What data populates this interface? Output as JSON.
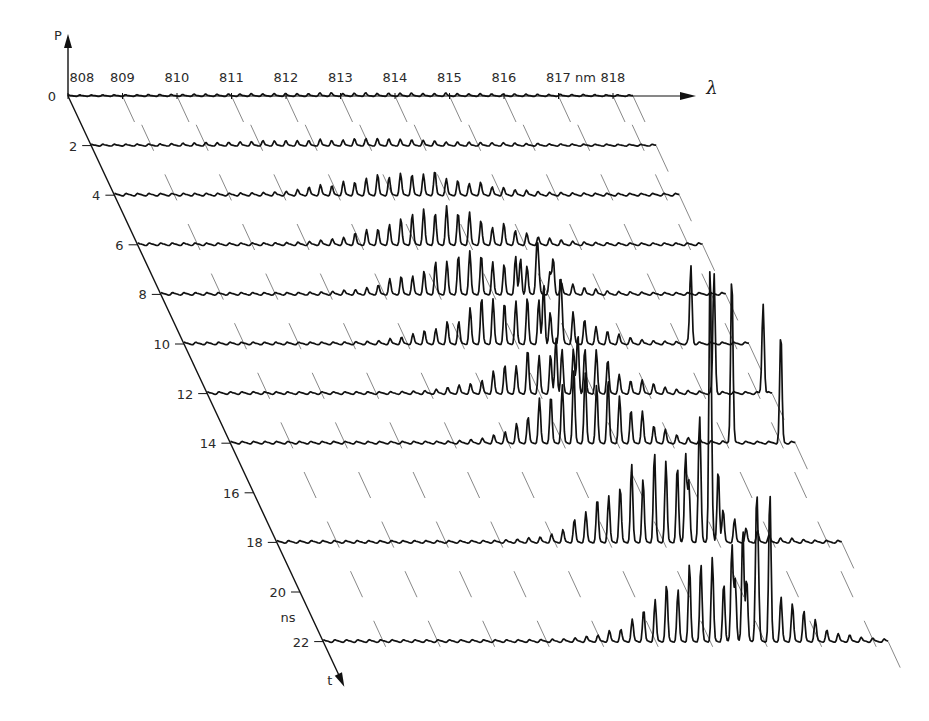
{
  "chart_data": {
    "type": "waterfall-line",
    "title": "",
    "xlabel": "λ",
    "x_unit": "nm",
    "x_unit_label_position_after": 817,
    "x_ticks": [
      808,
      809,
      810,
      811,
      812,
      813,
      814,
      815,
      816,
      817,
      818
    ],
    "ylabel": "P",
    "y_zero_label": "0",
    "zlabel": "t",
    "z_unit": "ns",
    "z_ticks": [
      0,
      2,
      4,
      6,
      8,
      10,
      12,
      14,
      16,
      18,
      20,
      22
    ],
    "z_tick_labels": [
      "0",
      "2",
      "4",
      "6",
      "8",
      "10",
      "12",
      "14",
      "16",
      "18",
      "20",
      "22"
    ],
    "mode_spacing_nm": 0.21,
    "grid": false,
    "legend": null,
    "series": [
      {
        "t_ns": 0,
        "center_nm": 813.5,
        "width_nm": 2.5,
        "peak": 2,
        "floor": 1.5,
        "spikes": []
      },
      {
        "t_ns": 2,
        "center_nm": 812.8,
        "width_nm": 1.8,
        "peak": 5,
        "floor": 2,
        "spikes": []
      },
      {
        "t_ns": 4,
        "center_nm": 813.4,
        "width_nm": 1.1,
        "peak": 22,
        "floor": 3,
        "spikes": []
      },
      {
        "t_ns": 6,
        "center_nm": 813.6,
        "width_nm": 1.0,
        "peak": 30,
        "floor": 3,
        "spikes": []
      },
      {
        "t_ns": 8,
        "center_nm": 813.8,
        "width_nm": 1.0,
        "peak": 42,
        "floor": 3,
        "spikes": [
          {
            "nm": 814.6,
            "h": 36
          },
          {
            "nm": 814.9,
            "h": 44
          },
          {
            "nm": 815.2,
            "h": 36
          }
        ]
      },
      {
        "t_ns": 10,
        "center_nm": 814.1,
        "width_nm": 1.0,
        "peak": 45,
        "floor": 3,
        "spikes": [
          {
            "nm": 814.6,
            "h": 60
          },
          {
            "nm": 814.9,
            "h": 54
          },
          {
            "nm": 817.3,
            "h": 78
          }
        ]
      },
      {
        "t_ns": 12,
        "center_nm": 814.4,
        "width_nm": 0.9,
        "peak": 48,
        "floor": 3,
        "spikes": [
          {
            "nm": 814.4,
            "h": 56
          },
          {
            "nm": 814.8,
            "h": 60
          },
          {
            "nm": 817.3,
            "h": 120
          },
          {
            "nm": 818.2,
            "h": 90
          }
        ]
      },
      {
        "t_ns": 14,
        "center_nm": 814.5,
        "width_nm": 0.8,
        "peak": 64,
        "floor": 3,
        "spikes": [
          {
            "nm": 817.2,
            "h": 170
          },
          {
            "nm": 818.1,
            "h": 110
          }
        ]
      },
      {
        "t_ns": 18,
        "center_nm": 815.0,
        "width_nm": 0.9,
        "peak": 78,
        "floor": 3,
        "spikes": [
          {
            "nm": 815.5,
            "h": 90
          },
          {
            "nm": 815.75,
            "h": 82
          },
          {
            "nm": 815.95,
            "h": 270
          },
          {
            "nm": 816.1,
            "h": 74
          }
        ]
      },
      {
        "t_ns": 22,
        "center_nm": 815.3,
        "width_nm": 1.0,
        "peak": 76,
        "floor": 3,
        "spikes": [
          {
            "nm": 815.5,
            "h": 98
          },
          {
            "nm": 815.7,
            "h": 115
          },
          {
            "nm": 815.95,
            "h": 122
          },
          {
            "nm": 816.2,
            "h": 95
          }
        ]
      }
    ]
  },
  "layout": {
    "origin_x": 68,
    "origin_y": 96,
    "px_per_nm": 54.5,
    "px_per_ns_x": 11.6,
    "px_per_ns_y": 24.8,
    "trace_length_px": 565,
    "tick_dx": 12,
    "tick_dy": 26,
    "amp_scale_px": 1.0
  },
  "colors": {
    "ink": "#111111",
    "tick": "#555555",
    "background": "#ffffff"
  }
}
